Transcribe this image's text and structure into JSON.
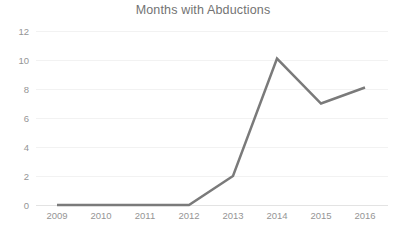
{
  "chart_data": {
    "type": "line",
    "title": "Months with Abductions",
    "xlabel": "",
    "ylabel": "",
    "categories": [
      "2009",
      "2010",
      "2011",
      "2012",
      "2013",
      "2014",
      "2015",
      "2016"
    ],
    "x": [
      2009,
      2010,
      2011,
      2012,
      2013,
      2014,
      2015,
      2016
    ],
    "values": [
      0,
      0,
      0,
      0,
      2,
      10.1,
      7,
      8.1
    ],
    "series": [
      {
        "name": "Months with Abductions",
        "values": [
          0,
          0,
          0,
          0,
          2,
          10.1,
          7,
          8.1
        ],
        "color": "#7a7a7a"
      }
    ],
    "ylim": [
      0,
      12
    ],
    "yticks": [
      0,
      2,
      4,
      6,
      8,
      10,
      12
    ],
    "ytick_labels": [
      "0",
      "2",
      "4",
      "6",
      "8",
      "10",
      "12"
    ],
    "grid": true,
    "grid_axis": "y",
    "legend": false,
    "legend_position": "none",
    "markers": false,
    "line_width": 2.5
  },
  "colors": {
    "background": "#ffffff",
    "line": "#7a7a7a",
    "gridline": "#f2f2f2",
    "axis": "#e3e3e3",
    "title_text": "#737373",
    "tick_text": "#959595"
  }
}
